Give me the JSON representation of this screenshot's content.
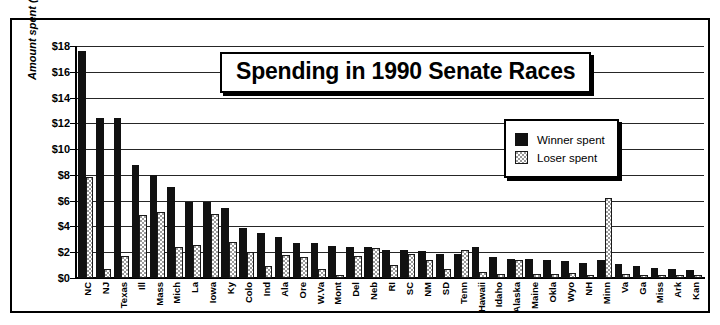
{
  "chart_data": {
    "type": "bar",
    "title": "Spending in 1990 Senate Races",
    "xlabel": "",
    "ylabel": "Amount spent (in millions)",
    "ylim": [
      0,
      18
    ],
    "ytick_labels": [
      "$0",
      "$2",
      "$4",
      "$6",
      "$8",
      "$10",
      "$12",
      "$14",
      "$16",
      "$18"
    ],
    "ytick_values": [
      0,
      2,
      4,
      6,
      8,
      10,
      12,
      14,
      16,
      18
    ],
    "grid": true,
    "legend_position": "upper-right-inside",
    "categories": [
      "NC",
      "NJ",
      "Texas",
      "Ill",
      "Mass",
      "Mich",
      "La",
      "Iowa",
      "Ky",
      "Colo",
      "Ind",
      "Ala",
      "Ore",
      "W.Va",
      "Mont",
      "Del",
      "Neb",
      "RI",
      "SC",
      "NM",
      "SD",
      "Tenn",
      "Hawaii",
      "Idaho",
      "Alaska",
      "Maine",
      "Okla",
      "Wyo",
      "NH",
      "Minn",
      "Va",
      "Ga",
      "Miss",
      "Ark",
      "Kan"
    ],
    "series": [
      {
        "name": "Winner spent",
        "color": "#111111",
        "values": [
          17.6,
          12.4,
          12.4,
          8.8,
          8.0,
          7.1,
          5.9,
          5.9,
          5.4,
          3.9,
          3.5,
          3.2,
          2.7,
          2.7,
          2.5,
          2.4,
          2.4,
          2.2,
          2.2,
          2.1,
          1.9,
          1.9,
          2.4,
          1.6,
          1.5,
          1.5,
          1.4,
          1.3,
          1.2,
          1.4,
          1.1,
          0.9,
          0.8,
          0.7,
          0.6
        ]
      },
      {
        "name": "Loser spent",
        "color": "#9a9a9a",
        "values": [
          7.8,
          0.7,
          1.7,
          4.9,
          5.1,
          2.4,
          2.6,
          5.0,
          2.8,
          2.0,
          0.9,
          1.8,
          1.6,
          0.7,
          0.2,
          1.7,
          2.3,
          1.0,
          1.9,
          1.4,
          0.7,
          2.2,
          0.5,
          0.3,
          1.4,
          0.3,
          0.3,
          0.4,
          0.2,
          6.2,
          0.3,
          0.2,
          0.2,
          0.2,
          0.2
        ]
      }
    ]
  },
  "legend": {
    "items": [
      {
        "label": "Winner spent",
        "swatch": "solid-black-swatch"
      },
      {
        "label": "Loser spent",
        "swatch": "checkered-gray-swatch"
      }
    ]
  }
}
